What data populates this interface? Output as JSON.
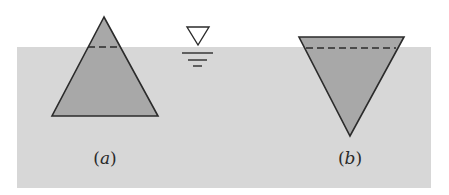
{
  "figure": {
    "colors": {
      "water": "#d7d7d7",
      "body_fill": "#a8a8a8",
      "outline": "#2b2b2b",
      "background": "#ffffff"
    },
    "water_region": {
      "x": 17,
      "y": 47,
      "width": 414,
      "height": 141
    },
    "free_surface_symbol": {
      "triangle": [
        [
          187,
          27
        ],
        [
          209,
          27
        ],
        [
          198,
          45
        ]
      ],
      "lines": [
        {
          "x1": 182,
          "x2": 213,
          "y": 53
        },
        {
          "x1": 188,
          "x2": 207,
          "y": 60
        },
        {
          "x1": 193,
          "x2": 202,
          "y": 66
        }
      ]
    },
    "bodies": [
      {
        "id": "a",
        "orientation": "apex-up",
        "vertices": [
          [
            104,
            17
          ],
          [
            52,
            116
          ],
          [
            158,
            116
          ]
        ],
        "waterline": {
          "x1": 88,
          "x2": 120,
          "y": 47
        }
      },
      {
        "id": "b",
        "orientation": "apex-down",
        "vertices": [
          [
            299,
            37
          ],
          [
            404,
            37
          ],
          [
            350,
            136
          ]
        ],
        "waterline": {
          "x1": 306,
          "x2": 396,
          "y": 48
        }
      }
    ],
    "labels": [
      {
        "open": "(",
        "letter": "a",
        "close": ")",
        "x": 105,
        "y": 158
      },
      {
        "open": "(",
        "letter": "b",
        "close": ")",
        "x": 350,
        "y": 158
      }
    ]
  }
}
